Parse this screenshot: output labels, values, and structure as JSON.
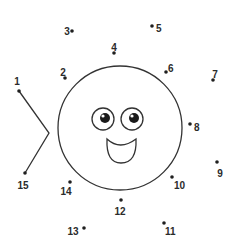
{
  "puzzle": {
    "type": "connect-the-dots",
    "ink_color": "#2b2b2b",
    "background": "#ffffff",
    "dots": [
      {
        "n": "1",
        "x": 19,
        "y": 91,
        "lx": 17,
        "ly": 82,
        "anchor": "middle"
      },
      {
        "n": "2",
        "x": 65,
        "y": 78,
        "lx": 63,
        "ly": 73,
        "anchor": "middle"
      },
      {
        "n": "3",
        "x": 72,
        "y": 31,
        "lx": 67,
        "ly": 32,
        "anchor": "middle"
      },
      {
        "n": "4",
        "x": 114,
        "y": 53,
        "lx": 114,
        "ly": 48,
        "anchor": "middle"
      },
      {
        "n": "5",
        "x": 152,
        "y": 26,
        "lx": 156,
        "ly": 29,
        "anchor": "start"
      },
      {
        "n": "6",
        "x": 166,
        "y": 72,
        "lx": 168,
        "ly": 69,
        "anchor": "start"
      },
      {
        "n": "7",
        "x": 213,
        "y": 80,
        "lx": 215,
        "ly": 75,
        "anchor": "middle"
      },
      {
        "n": "8",
        "x": 190,
        "y": 124,
        "lx": 194,
        "ly": 128,
        "anchor": "start"
      },
      {
        "n": "9",
        "x": 217,
        "y": 162,
        "lx": 220,
        "ly": 174,
        "anchor": "middle"
      },
      {
        "n": "10",
        "x": 172,
        "y": 177,
        "lx": 174,
        "ly": 186,
        "anchor": "start"
      },
      {
        "n": "11",
        "x": 164,
        "y": 223,
        "lx": 165,
        "ly": 232,
        "anchor": "start"
      },
      {
        "n": "12",
        "x": 121,
        "y": 200,
        "lx": 120,
        "ly": 212,
        "anchor": "middle"
      },
      {
        "n": "13",
        "x": 84,
        "y": 228,
        "lx": 73,
        "ly": 232,
        "anchor": "middle"
      },
      {
        "n": "14",
        "x": 70,
        "y": 182,
        "lx": 66,
        "ly": 192,
        "anchor": "middle"
      },
      {
        "n": "15",
        "x": 25,
        "y": 173,
        "lx": 23,
        "ly": 186,
        "anchor": "middle"
      }
    ],
    "tail_path": "M19,91 L49,133 L25,173",
    "body": {
      "cx": 120,
      "cy": 128,
      "r": 62
    },
    "eyes": [
      {
        "cx": 103,
        "cy": 119,
        "r": 11,
        "pupil_cx": 105,
        "pupil_cy": 118,
        "pupil_r": 5
      },
      {
        "cx": 132,
        "cy": 119,
        "r": 11,
        "pupil_cx": 134,
        "pupil_cy": 118,
        "pupil_r": 5
      }
    ],
    "mouth_path": "M107,139 Q120,151 136,139 Q137,163 121,163 Q106,163 107,139 Z"
  }
}
